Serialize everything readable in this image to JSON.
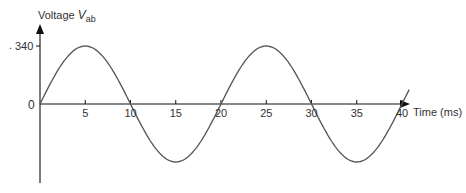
{
  "chart_data": {
    "type": "line",
    "title": "",
    "ylabel": "Voltage V_ab",
    "ylabel_main": "Voltage ",
    "ylabel_var": "V",
    "ylabel_sub": "ab",
    "xlabel": "Time (ms)",
    "xlim": [
      0,
      40
    ],
    "ylim": [
      -340,
      340
    ],
    "x_ticks": [
      5,
      10,
      15,
      20,
      25,
      30,
      35,
      40
    ],
    "x_tick_labels": [
      "5",
      "10",
      "15",
      "20",
      "25",
      "30",
      "35",
      "40"
    ],
    "y_ticks": [
      0,
      340
    ],
    "y_tick_labels": [
      "0",
      "340"
    ],
    "grid": false,
    "legend": null,
    "series": [
      {
        "name": "V_ab",
        "function": "340*sin(2*pi*t/20)",
        "amplitude": 340,
        "period_ms": 20,
        "x": [
          0,
          2.5,
          5,
          7.5,
          10,
          12.5,
          15,
          17.5,
          20,
          22.5,
          25,
          27.5,
          30,
          32.5,
          35,
          37.5,
          40,
          41
        ],
        "values": [
          0,
          240,
          340,
          240,
          0,
          -240,
          -340,
          -240,
          0,
          240,
          340,
          240,
          0,
          -240,
          -340,
          -240,
          0,
          105
        ]
      }
    ]
  },
  "labels": {
    "y_axis_main": "Voltage ",
    "y_axis_var": "V",
    "y_axis_sub": "ab",
    "x_axis": "Time (ms)",
    "y_340": "340",
    "origin": "0",
    "y_340_dot": "."
  },
  "colors": {
    "curve": "#555555",
    "axis": "#111111",
    "text": "#333333"
  }
}
